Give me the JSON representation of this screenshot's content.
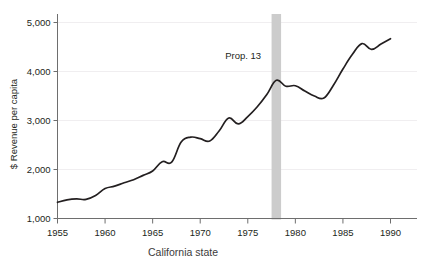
{
  "chart_data": {
    "type": "line",
    "title": "",
    "subtitle": "",
    "xlabel": "",
    "ylabel": "$ Revenue per capita",
    "xlim": [
      1955,
      1990
    ],
    "ylim": [
      1000,
      5000
    ],
    "xticks": [
      1955,
      1960,
      1965,
      1970,
      1975,
      1980,
      1985,
      1990
    ],
    "xtick_labels": [
      "1955",
      "1960",
      "1965",
      "1970",
      "1975",
      "1980",
      "1985",
      "1990"
    ],
    "yticks": [
      1000,
      2000,
      3000,
      4000,
      5000
    ],
    "ytick_labels": [
      "1,000",
      "2,000",
      "3,000",
      "4,000",
      "5,000"
    ],
    "grid": "horizontal",
    "legend": "none",
    "line_color": "#231f20",
    "x": [
      1955,
      1956,
      1957,
      1958,
      1959,
      1960,
      1961,
      1962,
      1963,
      1964,
      1965,
      1966,
      1967,
      1968,
      1969,
      1970,
      1971,
      1972,
      1973,
      1974,
      1975,
      1976,
      1977,
      1978,
      1979,
      1980,
      1981,
      1982,
      1983,
      1984,
      1985,
      1986,
      1987,
      1988,
      1989,
      1990
    ],
    "values": [
      1330,
      1380,
      1400,
      1390,
      1470,
      1610,
      1660,
      1730,
      1790,
      1880,
      1970,
      2160,
      2150,
      2560,
      2660,
      2630,
      2580,
      2790,
      3050,
      2930,
      3080,
      3280,
      3530,
      3820,
      3700,
      3710,
      3600,
      3500,
      3460,
      3720,
      4050,
      4350,
      4570,
      4450,
      4560,
      4670
    ],
    "annotations": [
      {
        "label": "Prop. 13",
        "type": "vertical-band",
        "x_start": 1977.5,
        "x_end": 1978.5,
        "band_color": "#cccccc",
        "label_x": 1976.4,
        "label_y": 4250
      }
    ],
    "series": [
      {
        "name": "Revenue per capita",
        "values": [
          1330,
          1380,
          1400,
          1390,
          1470,
          1610,
          1660,
          1730,
          1790,
          1880,
          1970,
          2160,
          2150,
          2560,
          2660,
          2630,
          2580,
          2790,
          3050,
          2930,
          3080,
          3280,
          3530,
          3820,
          3700,
          3710,
          3600,
          3500,
          3460,
          3720,
          4050,
          4350,
          4570,
          4450,
          4560,
          4670
        ]
      }
    ]
  },
  "caption": {
    "text": "California state"
  }
}
